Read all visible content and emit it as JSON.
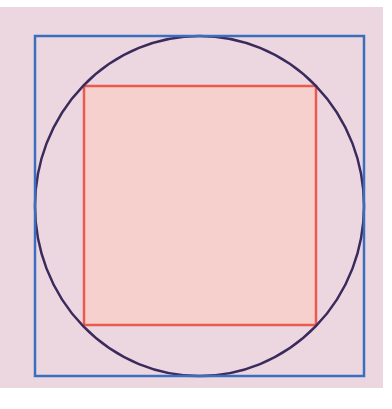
{
  "diagram": {
    "title": "",
    "background": {
      "x": 0,
      "y": 7,
      "width": 383,
      "height": 381,
      "color": "#ecd7e1"
    },
    "outer_square": {
      "x": 35,
      "y": 36,
      "width": 329,
      "height": 340,
      "stroke": "#3a6fbf",
      "stroke_width": 2.5,
      "fill": "none"
    },
    "circle": {
      "cx": 199.5,
      "cy": 206,
      "rx": 164.5,
      "ry": 170,
      "stroke": "#3b2a5c",
      "stroke_width": 2.5,
      "fill": "none"
    },
    "inner_square": {
      "x": 84,
      "y": 86,
      "width": 232,
      "height": 239,
      "stroke": "#ea5a4e",
      "stroke_width": 2.5,
      "fill": "#f6d0cc"
    }
  }
}
